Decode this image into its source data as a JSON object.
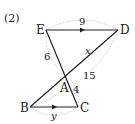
{
  "problem_label": "(2)",
  "points": {
    "E": {
      "label": "E",
      "x": 46,
      "y": 30
    },
    "D": {
      "label": "D",
      "x": 118,
      "y": 30
    },
    "A": {
      "label": "A",
      "x": 66,
      "y": 76
    },
    "B": {
      "label": "B",
      "x": 30,
      "y": 107
    },
    "C": {
      "label": "C",
      "x": 78,
      "y": 107
    }
  },
  "measures": {
    "ED": "9",
    "EA": "6",
    "AD": "x",
    "AD_total_arc": "15",
    "AC": "4",
    "BC": "y"
  },
  "colors": {
    "line": "#222222",
    "arc": "#bbbbbb"
  }
}
